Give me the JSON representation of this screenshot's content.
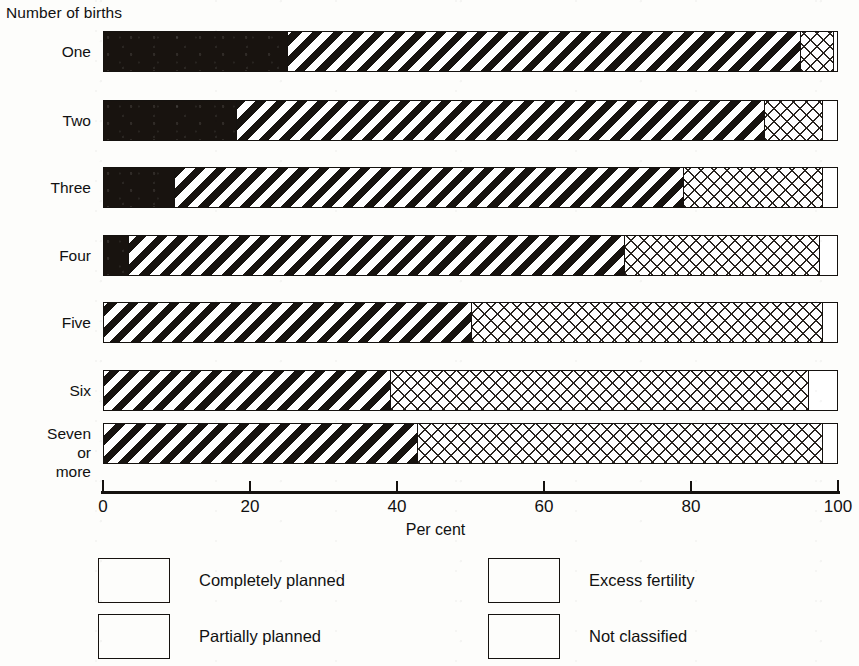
{
  "chart_data": {
    "type": "bar",
    "orientation": "horizontal",
    "stacked": true,
    "title": "",
    "xlabel": "Per cent",
    "ylabel": "Number of births",
    "xlim": [
      0,
      100
    ],
    "xticks": [
      0,
      20,
      40,
      60,
      80,
      100
    ],
    "xtick_labels": [
      "0",
      "20",
      "40",
      "60",
      "80",
      "100"
    ],
    "grid": false,
    "legend_position": "bottom",
    "categories": [
      "One",
      "Two",
      "Three",
      "Four",
      "Five",
      "Six",
      "Seven or\nmore"
    ],
    "series": [
      {
        "name": "Completely planned",
        "pattern": "solid-black",
        "values": [
          25.0,
          18.0,
          9.5,
          3.3,
          0.0,
          0.0,
          0.0
        ]
      },
      {
        "name": "Partially planned",
        "pattern": "diagonal-hatch",
        "values": [
          70.0,
          72.0,
          69.5,
          67.7,
          50.0,
          39.0,
          42.7
        ]
      },
      {
        "name": "Excess fertility",
        "pattern": "cross-hatch",
        "values": [
          4.5,
          8.0,
          19.0,
          26.5,
          48.0,
          57.0,
          55.3
        ]
      },
      {
        "name": "Not classified",
        "pattern": "white",
        "values": [
          0.5,
          2.0,
          2.0,
          2.5,
          2.0,
          4.0,
          2.0
        ]
      }
    ]
  },
  "axes": {
    "y_axis_title": "Number of births",
    "x_axis_title": "Per cent"
  },
  "legend": {
    "items": [
      {
        "label": "Completely planned",
        "pattern": "solid-black"
      },
      {
        "label": "Partially planned",
        "pattern": "diagonal-hatch"
      },
      {
        "label": "Excess fertility",
        "pattern": "cross-hatch"
      },
      {
        "label": "Not classified",
        "pattern": "white"
      }
    ]
  },
  "colors": {
    "ink": "#15120f",
    "paper": "#fdfdfb"
  }
}
